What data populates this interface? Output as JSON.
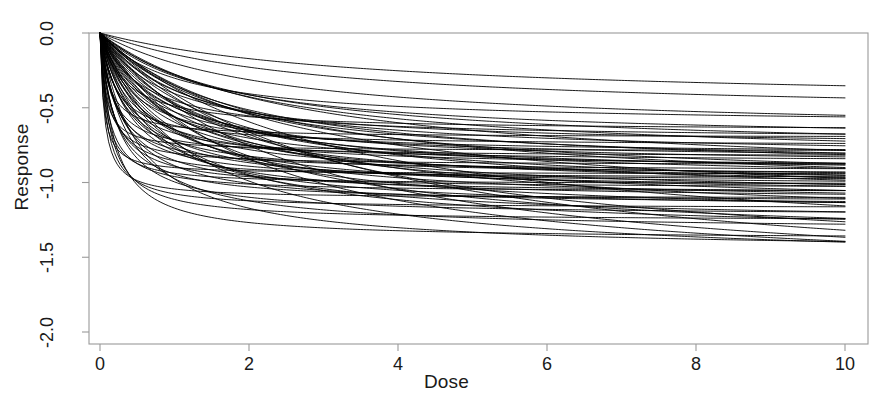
{
  "chart_data": {
    "type": "line",
    "title": "",
    "subtitle": "",
    "xlabel": "Dose",
    "ylabel": "Response",
    "xlim": [
      0,
      10
    ],
    "ylim": [
      -2.0,
      0.0
    ],
    "xticks": [
      0,
      2,
      4,
      6,
      8,
      10
    ],
    "xtick_labels": [
      "0",
      "2",
      "4",
      "6",
      "8",
      "10"
    ],
    "yticks": [
      0.0,
      -0.5,
      -1.0,
      -1.5,
      -2.0
    ],
    "ytick_labels": [
      "0.0",
      "-0.5",
      "-1.0",
      "-1.5",
      "-2.0"
    ],
    "grid": false,
    "legend": null,
    "legend_position": "none",
    "annotations": [],
    "line_color": "#000000",
    "line_width": 0.9,
    "frame_color": "#9a9a9a",
    "background": "#ffffff",
    "model": "Emax: response = emax * dose / (ed50 + dose)",
    "x_start": 0,
    "x_end": 10,
    "n_curves": 72,
    "series": [
      {
        "name": "curve-1",
        "emax": -0.48,
        "ed50": 3.6
      },
      {
        "name": "curve-2",
        "emax": -0.56,
        "ed50": 2.9
      },
      {
        "name": "curve-3",
        "emax": -0.62,
        "ed50": 1.05
      },
      {
        "name": "curve-4",
        "emax": -0.655,
        "ed50": 0.34
      },
      {
        "name": "curve-5",
        "emax": -0.68,
        "ed50": 2.35
      },
      {
        "name": "curve-6",
        "emax": -0.7,
        "ed50": 0.12
      },
      {
        "name": "curve-7",
        "emax": -0.715,
        "ed50": 0.58
      },
      {
        "name": "curve-8",
        "emax": -0.735,
        "ed50": 1.55
      },
      {
        "name": "curve-9",
        "emax": -0.755,
        "ed50": 0.22
      },
      {
        "name": "curve-10",
        "emax": -0.77,
        "ed50": 0.9
      },
      {
        "name": "curve-11",
        "emax": -0.79,
        "ed50": 0.07
      },
      {
        "name": "curve-12",
        "emax": -0.805,
        "ed50": 1.9
      },
      {
        "name": "curve-13",
        "emax": -0.815,
        "ed50": 0.45
      },
      {
        "name": "curve-14",
        "emax": -0.83,
        "ed50": 0.16
      },
      {
        "name": "curve-15",
        "emax": -0.845,
        "ed50": 1.2
      },
      {
        "name": "curve-16",
        "emax": -0.855,
        "ed50": 0.62
      },
      {
        "name": "curve-17",
        "emax": -0.865,
        "ed50": 0.29
      },
      {
        "name": "curve-18",
        "emax": -0.875,
        "ed50": 2.1
      },
      {
        "name": "curve-19",
        "emax": -0.885,
        "ed50": 0.1
      },
      {
        "name": "curve-20",
        "emax": -0.895,
        "ed50": 0.8
      },
      {
        "name": "curve-21",
        "emax": -0.905,
        "ed50": 0.4
      },
      {
        "name": "curve-22",
        "emax": -0.915,
        "ed50": 1.4
      },
      {
        "name": "curve-23",
        "emax": -0.925,
        "ed50": 0.19
      },
      {
        "name": "curve-24",
        "emax": -0.935,
        "ed50": 0.66
      },
      {
        "name": "curve-25",
        "emax": -0.945,
        "ed50": 0.05
      },
      {
        "name": "curve-26",
        "emax": -0.952,
        "ed50": 1.7
      },
      {
        "name": "curve-27",
        "emax": -0.96,
        "ed50": 0.33
      },
      {
        "name": "curve-28",
        "emax": -0.968,
        "ed50": 0.95
      },
      {
        "name": "curve-29",
        "emax": -0.975,
        "ed50": 0.14
      },
      {
        "name": "curve-30",
        "emax": -0.983,
        "ed50": 0.52
      },
      {
        "name": "curve-31",
        "emax": -0.99,
        "ed50": 2.6
      },
      {
        "name": "curve-32",
        "emax": -0.998,
        "ed50": 0.24
      },
      {
        "name": "curve-33",
        "emax": -1.005,
        "ed50": 1.1
      },
      {
        "name": "curve-34",
        "emax": -1.013,
        "ed50": 0.08
      },
      {
        "name": "curve-35",
        "emax": -1.02,
        "ed50": 0.71
      },
      {
        "name": "curve-36",
        "emax": -1.028,
        "ed50": 0.37
      },
      {
        "name": "curve-37",
        "emax": -1.035,
        "ed50": 1.85
      },
      {
        "name": "curve-38",
        "emax": -1.043,
        "ed50": 0.17
      },
      {
        "name": "curve-39",
        "emax": -1.05,
        "ed50": 0.87
      },
      {
        "name": "curve-40",
        "emax": -1.058,
        "ed50": 0.47
      },
      {
        "name": "curve-41",
        "emax": -1.066,
        "ed50": 0.11
      },
      {
        "name": "curve-42",
        "emax": -1.074,
        "ed50": 1.3
      },
      {
        "name": "curve-43",
        "emax": -1.082,
        "ed50": 0.27
      },
      {
        "name": "curve-44",
        "emax": -1.09,
        "ed50": 0.64
      },
      {
        "name": "curve-45",
        "emax": -1.098,
        "ed50": 2.2
      },
      {
        "name": "curve-46",
        "emax": -1.106,
        "ed50": 0.06
      },
      {
        "name": "curve-47",
        "emax": -1.115,
        "ed50": 1.0
      },
      {
        "name": "curve-48",
        "emax": -1.124,
        "ed50": 0.42
      },
      {
        "name": "curve-49",
        "emax": -1.133,
        "ed50": 0.2
      },
      {
        "name": "curve-50",
        "emax": -1.142,
        "ed50": 1.6
      },
      {
        "name": "curve-51",
        "emax": -1.152,
        "ed50": 0.76
      },
      {
        "name": "curve-52",
        "emax": -1.162,
        "ed50": 0.31
      },
      {
        "name": "curve-53",
        "emax": -1.173,
        "ed50": 0.09
      },
      {
        "name": "curve-54",
        "emax": -1.185,
        "ed50": 1.25
      },
      {
        "name": "curve-55",
        "emax": -1.197,
        "ed50": 0.55
      },
      {
        "name": "curve-56",
        "emax": -1.21,
        "ed50": 2.45
      },
      {
        "name": "curve-57",
        "emax": -1.225,
        "ed50": 0.23
      },
      {
        "name": "curve-58",
        "emax": -1.24,
        "ed50": 0.93
      },
      {
        "name": "curve-59",
        "emax": -1.258,
        "ed50": 0.13
      },
      {
        "name": "curve-60",
        "emax": -1.278,
        "ed50": 0.68
      },
      {
        "name": "curve-61",
        "emax": -1.3,
        "ed50": 1.75
      },
      {
        "name": "curve-62",
        "emax": -1.325,
        "ed50": 0.36
      },
      {
        "name": "curve-63",
        "emax": -1.352,
        "ed50": 0.85
      },
      {
        "name": "curve-64",
        "emax": -1.382,
        "ed50": 0.18
      },
      {
        "name": "curve-65",
        "emax": -1.42,
        "ed50": 1.45
      },
      {
        "name": "curve-66",
        "emax": -1.465,
        "ed50": 0.5
      },
      {
        "name": "curve-67",
        "emax": -1.515,
        "ed50": 3.1
      },
      {
        "name": "curve-68",
        "emax": -1.56,
        "ed50": 1.15
      },
      {
        "name": "curve-69",
        "emax": -1.61,
        "ed50": 2.75
      },
      {
        "name": "curve-70",
        "emax": -1.665,
        "ed50": 1.95
      },
      {
        "name": "curve-71",
        "emax": -1.715,
        "ed50": 2.55
      },
      {
        "name": "curve-72",
        "emax": -1.755,
        "ed50": 3.3
      }
    ]
  },
  "axes": {
    "x_title": "Dose",
    "y_title": "Response"
  }
}
